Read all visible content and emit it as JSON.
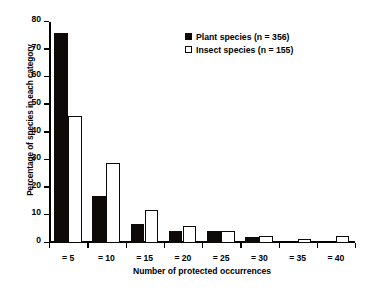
{
  "chart_data": {
    "type": "bar",
    "title": "",
    "xlabel": "Number of protected occurrences",
    "ylabel": "Percentage of species in each category",
    "categories": [
      "= 5",
      "= 10",
      "= 15",
      "= 20",
      "= 25",
      "= 30",
      "= 35",
      "= 40"
    ],
    "series": [
      {
        "name": "Plant species (n = 356)",
        "color": "#000000",
        "style": "filled",
        "values": [
          76,
          17,
          7,
          4.3,
          4.3,
          2.3,
          0,
          0
        ]
      },
      {
        "name": "Insect species (n = 155)",
        "color": "#ffffff",
        "style": "outlined",
        "values": [
          46,
          29,
          12,
          6.2,
          4.3,
          2.5,
          1.3,
          2.5
        ]
      }
    ],
    "ylim": [
      0,
      80
    ],
    "yticks": [
      0,
      10,
      20,
      30,
      40,
      50,
      60,
      70,
      80
    ],
    "ytick_labels": [
      "0",
      "10",
      "20",
      "30",
      "40",
      "50",
      "60",
      "70",
      "80"
    ],
    "grid": false,
    "legend_position": "upper-right-inside"
  },
  "axes": {
    "x_title": "Number of protected occurrences",
    "y_title": "Percentage of species in each category"
  },
  "legend": {
    "entries": [
      {
        "label": "Plant species (n = 356)",
        "swatch": "filled-square"
      },
      {
        "label": "Insect species (n = 155)",
        "swatch": "open-square"
      }
    ]
  }
}
